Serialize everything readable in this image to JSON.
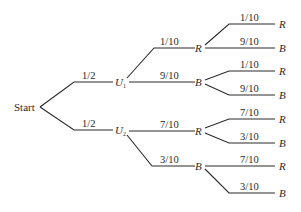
{
  "diagram": {
    "type": "probability-tree",
    "root": "Start",
    "level1": [
      {
        "label": "U",
        "subscript": "1",
        "prob": "1/2"
      },
      {
        "label": "U",
        "subscript": "2",
        "prob": "1/2"
      }
    ],
    "level2": [
      {
        "parent": "U1",
        "label": "R",
        "prob": "1/10"
      },
      {
        "parent": "U1",
        "label": "B",
        "prob": "9/10"
      },
      {
        "parent": "U2",
        "label": "R",
        "prob": "7/10"
      },
      {
        "parent": "U2",
        "label": "B",
        "prob": "3/10"
      }
    ],
    "level3": [
      {
        "parent": "U1-R",
        "label": "R",
        "prob": "1/10"
      },
      {
        "parent": "U1-R",
        "label": "B",
        "prob": "9/10"
      },
      {
        "parent": "U1-B",
        "label": "R",
        "prob": "1/10"
      },
      {
        "parent": "U1-B",
        "label": "B",
        "prob": "9/10"
      },
      {
        "parent": "U2-R",
        "label": "R",
        "prob": "7/10"
      },
      {
        "parent": "U2-R",
        "label": "B",
        "prob": "3/10"
      },
      {
        "parent": "U2-B",
        "label": "R",
        "prob": "7/10"
      },
      {
        "parent": "U2-B",
        "label": "B",
        "prob": "3/10"
      }
    ]
  },
  "colors": {
    "line": "#2a2a2a",
    "background": "#ffffff"
  }
}
